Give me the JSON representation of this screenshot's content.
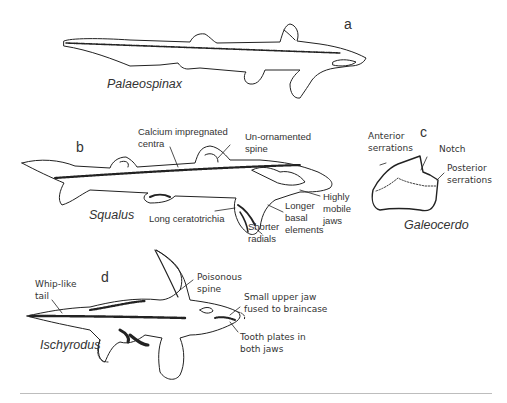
{
  "figure": {
    "panels": [
      {
        "id": "a",
        "panel_label": "a",
        "species": "Palaeospinax",
        "annotations": []
      },
      {
        "id": "b",
        "panel_label": "b",
        "species": "Squalus",
        "annotations": [
          "Calcium impregnated\ncentra",
          "Un-ornamented\nspine",
          "Highly\nmobile\njaws",
          "Longer\nbasal\nelements",
          "Shorter\nradials",
          "Long ceratotrichia"
        ]
      },
      {
        "id": "c",
        "panel_label": "c",
        "species": "Galeocerdo",
        "annotations": [
          "Anterior\nserrations",
          "Notch",
          "Posterior\nserrations"
        ]
      },
      {
        "id": "d",
        "panel_label": "d",
        "species": "Ischyrodus",
        "annotations": [
          "Whip-like\ntail",
          "Poisonous\nspine",
          "Small upper jaw\nfused to braincase",
          "Tooth plates in\nboth jaws"
        ]
      }
    ],
    "colors": {
      "line": "#222222",
      "text": "#333333",
      "rule": "#bdbdbd",
      "background": "#ffffff"
    }
  }
}
